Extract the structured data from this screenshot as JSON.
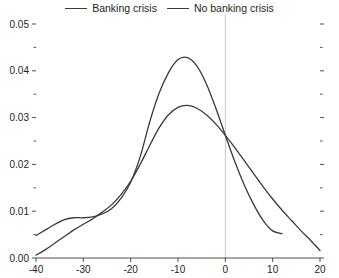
{
  "legend": {
    "position": "top-center",
    "entries": [
      {
        "label": "Banking crisis",
        "color": "#3a3a3a",
        "swatch": "line-swatch"
      },
      {
        "label": "No banking crisis",
        "color": "#3a3a3a",
        "swatch": "line-swatch"
      }
    ]
  },
  "axes": {
    "y_major_labels": [
      "0.00",
      "0.01",
      "0.02",
      "0.03",
      "0.04",
      "0.05"
    ],
    "x_major_labels": [
      "-40",
      "-30",
      "-20",
      "-10",
      "0",
      "10",
      "20"
    ]
  },
  "colors": {
    "line": "#3a3a3a",
    "axis": "#231f20",
    "reference_line": "#b8b8b8",
    "background": "#ffffff"
  },
  "chart_data": {
    "type": "line",
    "title": "",
    "subtitle": "",
    "xlabel": "",
    "ylabel": "",
    "xlim": [
      -40,
      20
    ],
    "ylim": [
      0.0,
      0.05
    ],
    "xticks": [
      -40,
      -30,
      -20,
      -10,
      0,
      10,
      20
    ],
    "yticks": [
      0.0,
      0.01,
      0.02,
      0.03,
      0.04,
      0.05
    ],
    "yticks_minor": [
      0.005,
      0.015,
      0.025,
      0.035,
      0.045
    ],
    "grid": false,
    "legend_position": "top-center",
    "reference_lines": [
      {
        "axis": "x",
        "value": 0,
        "color": "#b8b8b8"
      }
    ],
    "series": [
      {
        "name": "Banking crisis",
        "color": "#3a3a3a",
        "x": [
          -40,
          -38,
          -36,
          -34,
          -32,
          -30,
          -28,
          -26,
          -24,
          -22,
          -20,
          -18,
          -16,
          -14,
          -12,
          -10,
          -8,
          -6,
          -4,
          -2,
          0,
          2,
          4,
          6,
          8,
          10,
          12
        ],
        "y": [
          0.0048,
          0.006,
          0.0072,
          0.0082,
          0.0086,
          0.0086,
          0.0088,
          0.0094,
          0.0106,
          0.0128,
          0.0162,
          0.0216,
          0.029,
          0.0352,
          0.0396,
          0.0424,
          0.0428,
          0.041,
          0.0372,
          0.032,
          0.0262,
          0.0206,
          0.0156,
          0.0114,
          0.008,
          0.0058,
          0.0052
        ]
      },
      {
        "name": "No banking crisis",
        "color": "#3a3a3a",
        "x": [
          -40,
          -38,
          -36,
          -34,
          -32,
          -30,
          -28,
          -26,
          -24,
          -22,
          -20,
          -18,
          -16,
          -14,
          -12,
          -10,
          -8,
          -6,
          -4,
          -2,
          0,
          2,
          4,
          6,
          8,
          10,
          12,
          14,
          16,
          18,
          20
        ],
        "y": [
          0.0006,
          0.0018,
          0.0032,
          0.0046,
          0.006,
          0.0072,
          0.0084,
          0.0098,
          0.0114,
          0.0136,
          0.0164,
          0.02,
          0.024,
          0.0278,
          0.0306,
          0.0322,
          0.0326,
          0.032,
          0.0306,
          0.0286,
          0.0262,
          0.0236,
          0.0208,
          0.018,
          0.0152,
          0.0126,
          0.0102,
          0.008,
          0.0058,
          0.0038,
          0.0016
        ]
      }
    ]
  }
}
